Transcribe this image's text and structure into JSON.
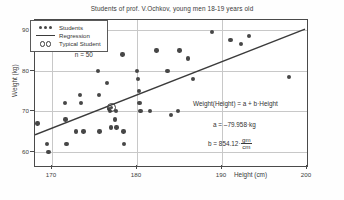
{
  "chart_data": {
    "type": "scatter",
    "title": "Students of prof. V.Ochkov, young men 18-19 years old",
    "xlabel": "Height (cm)",
    "ylabel": "Weight (kg)",
    "xlim": [
      168,
      200
    ],
    "ylim": [
      56.5,
      92.5
    ],
    "xticks": [
      "170",
      "180",
      "190",
      "200"
    ],
    "xtick_values": [
      170,
      180,
      190,
      200
    ],
    "yticks": [
      "60",
      "70",
      "80",
      "90"
    ],
    "ytick_values": [
      60,
      70,
      80,
      90
    ],
    "grid": true,
    "legend_position": "top-left",
    "annotations": {
      "sample_size": "n = 50",
      "model": "Weight(Height) = a + b·Height",
      "intercept": "a = –79.958·kg",
      "slope_label": "b = 854.12·",
      "slope_numerator": "gm",
      "slope_denominator": "cm"
    },
    "series": [
      {
        "name": "Students",
        "marker": "filled-circle",
        "color": "#474747",
        "points": [
          [
            168.3,
            67.0
          ],
          [
            169.4,
            62.0
          ],
          [
            169.6,
            60.0
          ],
          [
            171.5,
            72.0
          ],
          [
            171.6,
            68.0
          ],
          [
            171.7,
            62.0
          ],
          [
            172.8,
            65.0
          ],
          [
            173.3,
            74.0
          ],
          [
            173.4,
            72.0
          ],
          [
            173.7,
            65.0
          ],
          [
            175.4,
            80.0
          ],
          [
            175.5,
            74.0
          ],
          [
            175.6,
            65.0
          ],
          [
            176.5,
            77.0
          ],
          [
            176.7,
            70.5
          ],
          [
            176.8,
            70.0
          ],
          [
            176.9,
            66.0
          ],
          [
            177.4,
            68.0
          ],
          [
            177.5,
            70.0
          ],
          [
            177.6,
            66.0
          ],
          [
            178.3,
            84.0
          ],
          [
            178.4,
            65.0
          ],
          [
            178.5,
            62.0
          ],
          [
            180.0,
            80.0
          ],
          [
            180.1,
            78.0
          ],
          [
            180.2,
            75.0
          ],
          [
            180.3,
            72.0
          ],
          [
            180.4,
            70.0
          ],
          [
            181.5,
            70.0
          ],
          [
            182.3,
            85.0
          ],
          [
            183.6,
            80.0
          ],
          [
            184.0,
            69.0
          ],
          [
            184.8,
            70.0
          ],
          [
            185.0,
            85.0
          ],
          [
            186.0,
            83.0
          ],
          [
            186.6,
            78.0
          ],
          [
            188.8,
            89.5
          ],
          [
            191.0,
            87.5
          ],
          [
            192.2,
            86.5
          ],
          [
            193.2,
            88.5
          ],
          [
            197.9,
            78.5
          ]
        ]
      }
    ],
    "regression": {
      "name": "Regression",
      "color": "#3b3b3b",
      "x_start": 168,
      "y_start": 63.8,
      "x_end": 200,
      "y_end": 90.2
    },
    "typical_student": {
      "name": "Typical Student",
      "x": 177.0,
      "y": 71.0
    }
  },
  "legend": {
    "items": [
      {
        "label": "Students",
        "key": "dots"
      },
      {
        "label": "Regression",
        "key": "line"
      },
      {
        "label": "Typical Student",
        "key": "circles"
      }
    ]
  }
}
